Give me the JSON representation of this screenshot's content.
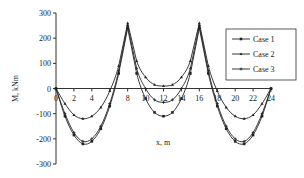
{
  "chart_data": {
    "type": "line",
    "title": "",
    "xlabel": "x, m",
    "ylabel": "M, kNm",
    "xlim": [
      0,
      24
    ],
    "ylim": [
      -300,
      300
    ],
    "xticks": [
      0,
      2,
      4,
      6,
      8,
      10,
      12,
      14,
      16,
      18,
      20,
      22,
      24
    ],
    "xtick_labels": [
      "0",
      "2",
      "4",
      "",
      "8",
      "10",
      "12",
      "14",
      "16",
      "18",
      "20",
      "22",
      "24"
    ],
    "yticks": [
      300,
      200,
      100,
      0,
      -100,
      -200,
      -300
    ],
    "grid": false,
    "legend_position": "upper right",
    "x": [
      0,
      1,
      2,
      3,
      4,
      5,
      6,
      7,
      8,
      9,
      10,
      11,
      12,
      13,
      14,
      15,
      16,
      17,
      18,
      19,
      20,
      21,
      22,
      23,
      24
    ],
    "series": [
      {
        "name": "Case 1",
        "marker": "square",
        "values": [
          0,
          -110,
          -185,
          -220,
          -210,
          -160,
          -70,
          60,
          240,
          60,
          -40,
          -95,
          -110,
          -95,
          -40,
          60,
          240,
          60,
          -70,
          -160,
          -210,
          -220,
          -185,
          -110,
          0
        ]
      },
      {
        "name": "Case 2",
        "marker": "triangle",
        "values": [
          0,
          -60,
          -105,
          -120,
          -110,
          -75,
          -10,
          90,
          260,
          110,
          45,
          15,
          10,
          15,
          45,
          110,
          260,
          90,
          -10,
          -75,
          -110,
          -120,
          -105,
          -60,
          0
        ]
      },
      {
        "name": "Case 3",
        "marker": "plus",
        "values": [
          0,
          -100,
          -175,
          -210,
          -200,
          -150,
          -60,
          70,
          250,
          80,
          0,
          -45,
          -55,
          -45,
          0,
          80,
          250,
          70,
          -60,
          -150,
          -200,
          -210,
          -175,
          -100,
          0
        ]
      }
    ]
  }
}
